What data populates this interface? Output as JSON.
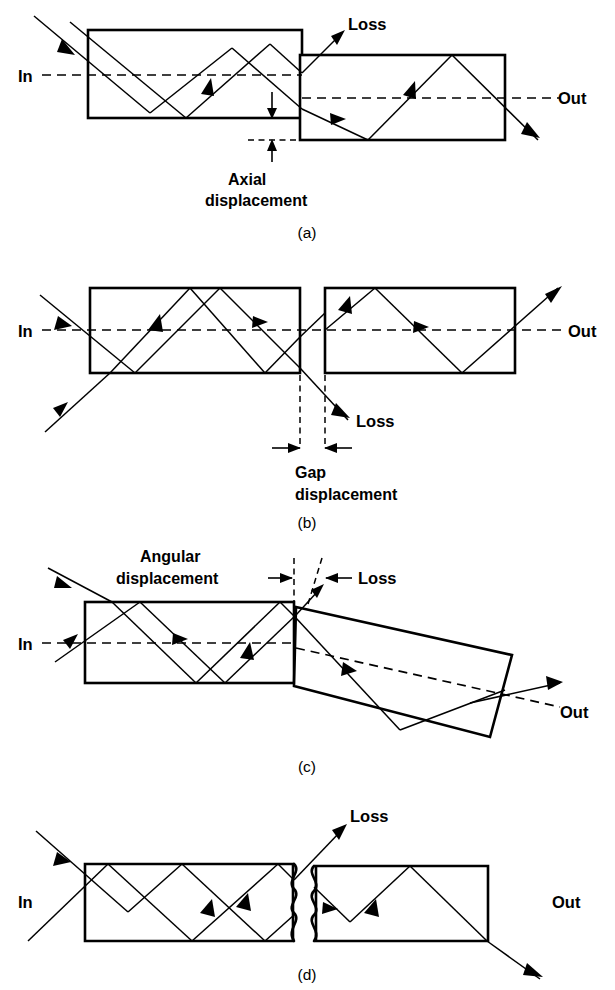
{
  "figure": {
    "background_color": "#ffffff",
    "line_color": "#000000",
    "width": 615,
    "height": 990
  },
  "panels": [
    {
      "id": "a",
      "letter": "(a)",
      "caption_key": "axial",
      "mechanism": "Axial displacement",
      "labels": {
        "input": "In",
        "output": "Out",
        "loss": "Loss",
        "dimension_line1": "Axial",
        "dimension_line2": "displacement"
      }
    },
    {
      "id": "b",
      "letter": "(b)",
      "caption_key": "gap",
      "mechanism": "Gap displacement",
      "labels": {
        "input": "In",
        "output": "Out",
        "loss": "Loss",
        "dimension_line1": "Gap",
        "dimension_line2": "displacement"
      }
    },
    {
      "id": "c",
      "letter": "(c)",
      "caption_key": "angular",
      "mechanism": "Angular displacement",
      "labels": {
        "input": "In",
        "output": "Out",
        "loss": "Loss",
        "dimension_line1": "Angular",
        "dimension_line2": "displacement"
      }
    },
    {
      "id": "d",
      "letter": "(d)",
      "caption_key": "roughness",
      "mechanism": "End face roughness / irregularity",
      "labels": {
        "input": "In",
        "output": "Out",
        "loss": "Loss",
        "dimension_line1": "",
        "dimension_line2": ""
      }
    }
  ],
  "icons": {
    "arrowhead": "ray-arrowhead",
    "dimension_arrow": "dimension-arrow",
    "wavy_face": "rough-endface-icon"
  }
}
